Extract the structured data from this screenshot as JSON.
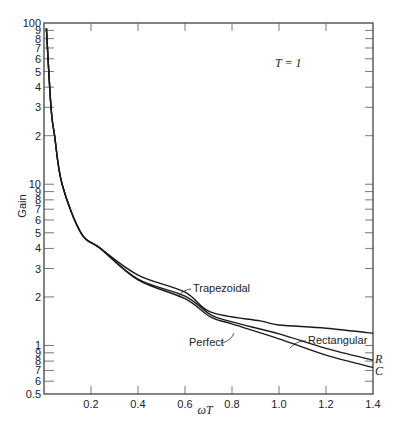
{
  "chart_data": {
    "type": "line",
    "title": "",
    "annotation_title": "T = 1",
    "xlabel": "ωT",
    "ylabel": "Gain",
    "xlim": [
      0,
      1.4
    ],
    "ylim": [
      0.5,
      100
    ],
    "yscale": "log",
    "grid": false,
    "x_ticks": [
      0.2,
      0.4,
      0.6,
      0.8,
      1.0,
      1.2,
      1.4
    ],
    "x_tick_labels": [
      "0.2",
      "0.4",
      "0.6",
      "0.8",
      "1.0",
      "1.2",
      "1.4"
    ],
    "y_ticks": [
      {
        "value": 100,
        "label": "100"
      },
      {
        "value": 90,
        "label": "9"
      },
      {
        "value": 80,
        "label": "8"
      },
      {
        "value": 70,
        "label": "7"
      },
      {
        "value": 60,
        "label": "6"
      },
      {
        "value": 50,
        "label": "5"
      },
      {
        "value": 40,
        "label": "4"
      },
      {
        "value": 30,
        "label": "3"
      },
      {
        "value": 20,
        "label": "2"
      },
      {
        "value": 10,
        "label": "10"
      },
      {
        "value": 9,
        "label": "9"
      },
      {
        "value": 8,
        "label": "8"
      },
      {
        "value": 7,
        "label": "7"
      },
      {
        "value": 6,
        "label": "6"
      },
      {
        "value": 5,
        "label": "5"
      },
      {
        "value": 4,
        "label": "4"
      },
      {
        "value": 3,
        "label": "3"
      },
      {
        "value": 2,
        "label": "2"
      },
      {
        "value": 1,
        "label": "1"
      },
      {
        "value": 0.9,
        "label": "9"
      },
      {
        "value": 0.8,
        "label": "8"
      },
      {
        "value": 0.7,
        "label": "7"
      },
      {
        "value": 0.6,
        "label": "6"
      },
      {
        "value": 0.5,
        "label": "0.5"
      }
    ],
    "series": [
      {
        "name": "Trapezoidal",
        "x": [
          0.01,
          0.03,
          0.045,
          0.077,
          0.157,
          0.24,
          0.4,
          0.6,
          0.71,
          0.92,
          1.0,
          1.2,
          1.4
        ],
        "values": [
          93,
          30,
          20,
          10,
          5,
          4,
          2.73,
          2.14,
          1.61,
          1.42,
          1.34,
          1.28,
          1.19
        ]
      },
      {
        "name": "Rectangular",
        "end_label": "R",
        "x": [
          0.01,
          0.03,
          0.045,
          0.077,
          0.157,
          0.24,
          0.4,
          0.6,
          0.71,
          0.8,
          1.0,
          1.2,
          1.4
        ],
        "values": [
          93,
          30,
          20,
          10,
          5,
          4,
          2.58,
          2.02,
          1.55,
          1.4,
          1.18,
          0.96,
          0.81
        ]
      },
      {
        "name": "Perfect",
        "end_label": "C",
        "x": [
          0.01,
          0.03,
          0.045,
          0.077,
          0.157,
          0.24,
          0.4,
          0.6,
          0.71,
          0.8,
          1.0,
          1.2,
          1.4
        ],
        "values": [
          93,
          30,
          20,
          10,
          5,
          4,
          2.55,
          1.95,
          1.5,
          1.36,
          1.1,
          0.87,
          0.73
        ]
      }
    ],
    "annotations": [
      {
        "text": "Trapezoidal",
        "series": "Trapezoidal"
      },
      {
        "text": "Rectangular",
        "series": "Rectangular"
      },
      {
        "text": "Perfect",
        "series": "Perfect"
      },
      {
        "text": "R",
        "series": "Rectangular"
      },
      {
        "text": "C",
        "series": "Perfect"
      }
    ]
  }
}
